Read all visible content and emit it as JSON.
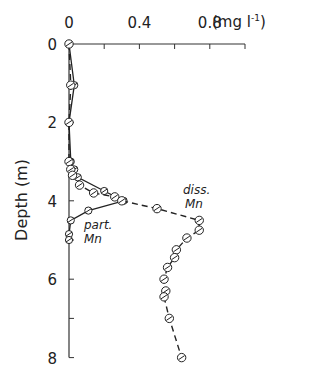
{
  "chart_data": {
    "type": "line",
    "title": "",
    "xlabel": "(mg l⁻¹)",
    "ylabel": "Depth (m)",
    "x_axis_position": "top",
    "y_inverted": true,
    "xlim": [
      0,
      1.0
    ],
    "ylim": [
      0,
      8
    ],
    "x_ticks": [
      0,
      0.2,
      0.4,
      0.6,
      0.8,
      1.0
    ],
    "x_tick_labels": [
      "0",
      "0.4",
      "0.8"
    ],
    "x_tick_label_values": [
      0,
      0.4,
      0.8
    ],
    "y_ticks": [
      0,
      1,
      2,
      3,
      4,
      5,
      6,
      7,
      8
    ],
    "y_tick_labels": [
      "0",
      "2",
      "4",
      "6",
      "8"
    ],
    "y_tick_label_values": [
      0,
      2,
      4,
      6,
      8
    ],
    "grid": false,
    "series": [
      {
        "name": "part. Mn",
        "style": "solid",
        "marker": "circle-filled",
        "depth": [
          0,
          1.05,
          2.0,
          3.0,
          3.2,
          3.4,
          3.75,
          4.0,
          4.25,
          4.5,
          4.85,
          5.0
        ],
        "values": [
          0.0,
          0.03,
          0.0,
          0.01,
          0.03,
          0.05,
          0.2,
          0.31,
          0.11,
          0.01,
          0.0,
          0.0
        ]
      },
      {
        "name": "diss. Mn",
        "style": "dashed",
        "marker": "circle-open",
        "depth": [
          0,
          1.05,
          2.0,
          3.0,
          3.2,
          3.35,
          3.6,
          3.8,
          3.9,
          4.0,
          4.2,
          4.5,
          4.75,
          4.95,
          5.25,
          5.45,
          5.7,
          6.0,
          6.3,
          6.45,
          7.0,
          8.0
        ],
        "values": [
          0.0,
          0.01,
          0.0,
          0.0,
          0.01,
          0.02,
          0.06,
          0.14,
          0.26,
          0.3,
          0.5,
          0.74,
          0.74,
          0.67,
          0.61,
          0.6,
          0.56,
          0.54,
          0.55,
          0.54,
          0.57,
          0.64
        ]
      }
    ],
    "annotations": [
      {
        "text": "diss.",
        "line2": "Mn",
        "near": "diss. Mn peak"
      },
      {
        "text": "part.",
        "line2": "Mn",
        "near": "part. Mn below peak"
      }
    ]
  },
  "labels": {
    "x_unit": "(mg l",
    "x_unit_sup": "-1",
    "x_unit_close": ")",
    "y_axis": "Depth (m)",
    "diss_line1": "diss.",
    "diss_line2": "Mn",
    "part_line1": "part.",
    "part_line2": "Mn"
  }
}
